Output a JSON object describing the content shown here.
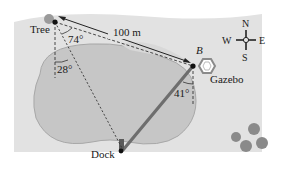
{
  "diagram": {
    "labels": {
      "tree": "Tree",
      "gazebo": "Gazebo",
      "dock": "Dock",
      "point_b": "B",
      "distance": "100 m"
    },
    "angles": {
      "tree_74": "74°",
      "tree_28": "28°",
      "b_41": "41°"
    },
    "compass": {
      "north": "N",
      "south": "S",
      "east": "E",
      "west": "W"
    },
    "colors": {
      "land": "#e2e2e2",
      "lake": "#c6c6c6",
      "lake_edge": "#a8a8a8",
      "bridge": "#6e6e6e",
      "bush": "#8a8a8a",
      "tree_canopy": "#9a9a9a"
    }
  }
}
